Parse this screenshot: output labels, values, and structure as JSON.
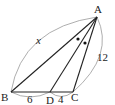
{
  "diagram": {
    "type": "triangle-angle-bisector",
    "points": {
      "A": {
        "label": "A",
        "x": 97,
        "y": 17
      },
      "B": {
        "label": "B",
        "x": 11,
        "y": 92
      },
      "D": {
        "label": "D",
        "x": 50,
        "y": 92
      },
      "C": {
        "label": "C",
        "x": 73,
        "y": 92
      }
    },
    "segments": [
      "AB",
      "AD",
      "AC",
      "BC"
    ],
    "measures": {
      "AB": "x",
      "AC": "12",
      "BD": "6",
      "DC": "4"
    },
    "angle_marks": [
      {
        "angle": "BAD",
        "mark": "dot"
      },
      {
        "angle": "DAC",
        "mark": "dot"
      }
    ],
    "colors": {
      "line": "#222222",
      "arc": "#888888",
      "label": "#222222"
    }
  }
}
